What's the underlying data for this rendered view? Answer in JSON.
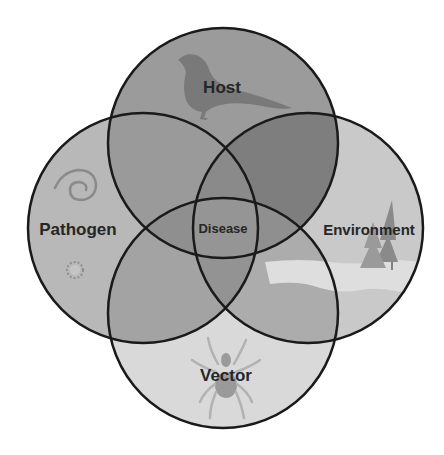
{
  "diagram": {
    "type": "venn",
    "circles": [
      {
        "id": "host",
        "label": "Host",
        "cx": 223,
        "cy": 143,
        "r": 115,
        "fill": "#8c8c8c",
        "icon": "bird-icon"
      },
      {
        "id": "pathogen",
        "label": "Pathogen",
        "cx": 143,
        "cy": 228,
        "r": 115,
        "fill": "#b3b3b3",
        "icon": "microbe-icon"
      },
      {
        "id": "environment",
        "label": "Environment",
        "cx": 308,
        "cy": 228,
        "r": 115,
        "fill": "#c4c4c4",
        "icon": "tree-landscape-icon"
      },
      {
        "id": "vector",
        "label": "Vector",
        "cx": 223,
        "cy": 313,
        "r": 115,
        "fill": "#d9d9d9",
        "icon": "tick-icon"
      }
    ],
    "center_label": "Disease",
    "stroke_color": "#1a1a1a",
    "background": "#ffffff"
  }
}
